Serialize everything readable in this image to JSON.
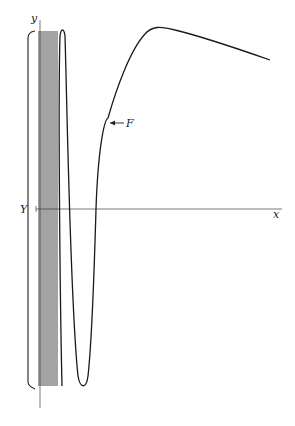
{
  "figure": {
    "labels": {
      "y_axis": "y",
      "x_axis": "x",
      "point_Y": "Y",
      "curve": "F"
    },
    "colors": {
      "ink": "#1a1a1a",
      "axis": "#555555",
      "background": "#ffffff"
    }
  }
}
